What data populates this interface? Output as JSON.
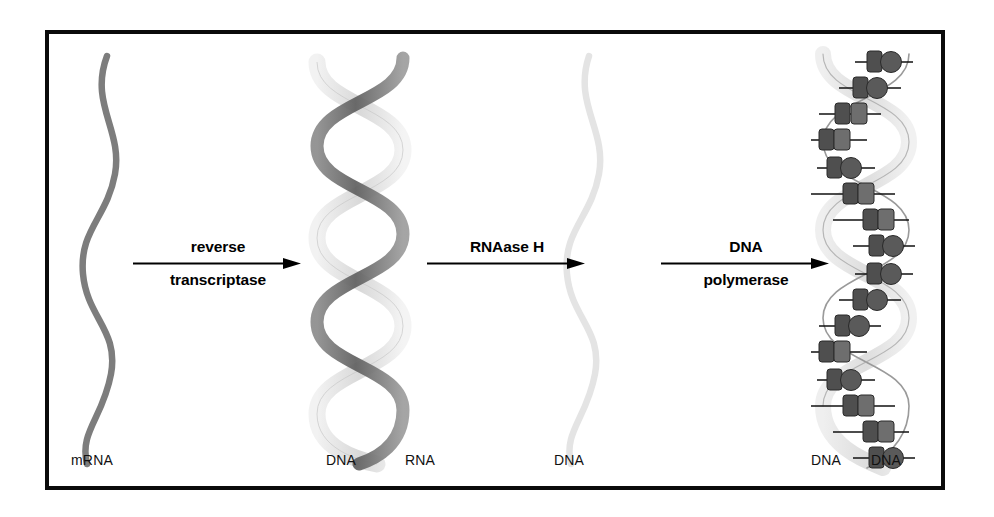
{
  "figure": {
    "background_color": "#ffffff",
    "frame_color": "#0a0a0a"
  },
  "stages": [
    {
      "id": "stage-mrna",
      "molecule": "single-stranded-rna",
      "labels": [
        "mRNA"
      ],
      "strand_color": "#7d7d7d"
    },
    {
      "id": "stage-rna-dna-hybrid",
      "molecule": "double-helix-hybrid",
      "labels": [
        "DNA",
        "RNA"
      ],
      "strand_color": "#6e6e6e",
      "second_strand_color": "#e6e6e6"
    },
    {
      "id": "stage-ssdna",
      "molecule": "single-stranded-dna",
      "labels": [
        "DNA"
      ],
      "strand_color": "#e4e4e4"
    },
    {
      "id": "stage-dsdna",
      "molecule": "double-helix-dna-with-bases",
      "labels": [
        "DNA",
        "DNA"
      ],
      "strand_color": "#9a9a9a",
      "second_strand_color": "#e2e2e2",
      "base_color": "#4a4a4a"
    }
  ],
  "arrows": [
    {
      "id": "arrow-reverse-transcriptase",
      "above": "reverse",
      "below": "transcriptase"
    },
    {
      "id": "arrow-rnaase-h",
      "above": "RNAase H",
      "below": ""
    },
    {
      "id": "arrow-dna-polymerase",
      "above": "DNA",
      "below": "polymerase"
    }
  ],
  "labels": {
    "mrna": "mRNA",
    "hybrid_dna": "DNA",
    "hybrid_rna": "RNA",
    "ssdna": "DNA",
    "dsdna_left": "DNA",
    "dsdna_right": "DNA"
  },
  "side_caption": {
    "lines": [
      "",
      "",
      "",
      "",
      "",
      ""
    ]
  }
}
